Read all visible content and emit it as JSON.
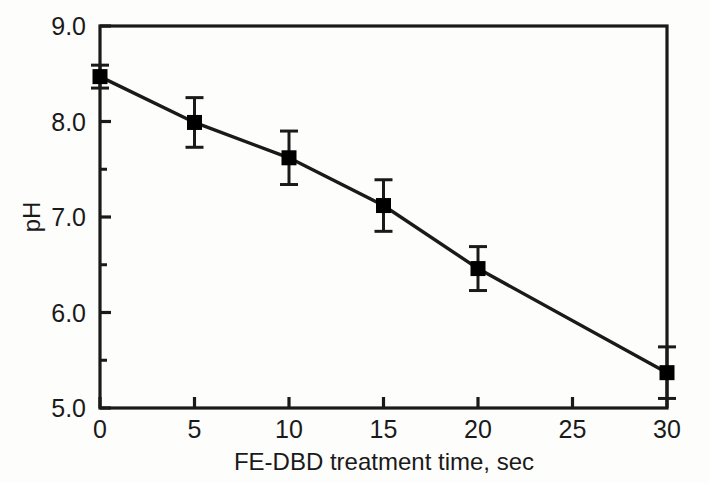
{
  "chart_data": {
    "type": "line",
    "title": "",
    "xlabel": "FE-DBD treatment time, sec",
    "ylabel": "pH",
    "xlim": [
      0,
      30
    ],
    "ylim": [
      5.0,
      9.0
    ],
    "grid": false,
    "legend": "none",
    "x": [
      0,
      5,
      10,
      15,
      20,
      30
    ],
    "values": [
      8.47,
      7.99,
      7.62,
      7.12,
      6.46,
      5.37
    ],
    "errors": [
      0.12,
      0.26,
      0.28,
      0.27,
      0.23,
      0.27
    ],
    "series": [
      {
        "name": "pH",
        "x": [
          0,
          5,
          10,
          15,
          20,
          30
        ],
        "values": [
          8.47,
          7.99,
          7.62,
          7.12,
          6.46,
          5.37
        ],
        "errors": [
          0.12,
          0.26,
          0.28,
          0.27,
          0.23,
          0.27
        ],
        "marker": "filled-square",
        "color": "#000000"
      }
    ],
    "xticks": [
      0,
      5,
      10,
      15,
      20,
      25,
      30
    ],
    "xtick_labels": [
      "0",
      "5",
      "10",
      "15",
      "20",
      "25",
      "30"
    ],
    "yticks": [
      5.0,
      6.0,
      7.0,
      8.0,
      9.0
    ],
    "ytick_labels": [
      "5.0",
      "6.0",
      "7.0",
      "8.0",
      "9.0"
    ],
    "yticks_minor": [
      5.5,
      6.5,
      7.5,
      8.5
    ]
  },
  "axes": {
    "y_axis_title": "pH",
    "x_axis_title": "FE-DBD treatment time, sec"
  },
  "colors": {
    "line": "#1a1a1a",
    "marker": "#000000",
    "axis": "#1a1a1a",
    "background": "#fdfdfc"
  }
}
